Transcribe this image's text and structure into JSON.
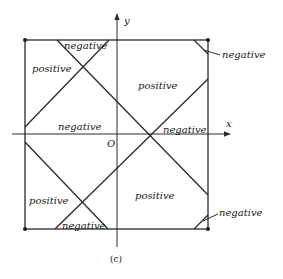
{
  "figure": {
    "caption": "(c)",
    "axes": {
      "x_label": "x",
      "y_label": "y",
      "origin_label": "O"
    },
    "region_labels": {
      "top_triangle": "negative",
      "top_left": "positive",
      "top_right": "positive",
      "middle_left": "negative",
      "middle_right": "negative",
      "bottom_left": "positive",
      "bottom_right": "positive",
      "bottom_triangle": "negative",
      "corner_top_right": "negative",
      "corner_bottom_right": "negative"
    },
    "colors": {
      "stroke": "#2a2a2a",
      "background": "#ffffff"
    }
  }
}
